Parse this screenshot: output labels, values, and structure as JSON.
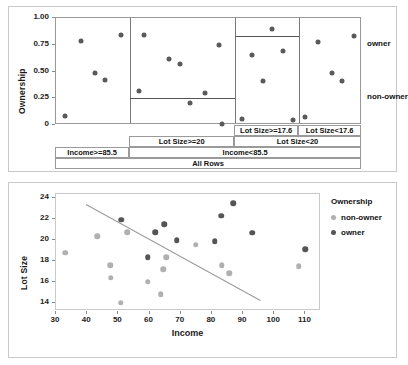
{
  "chart_data": [
    {
      "type": "scatter",
      "id": "partition-plot",
      "title": "",
      "ylabel": "Ownership",
      "xlabel": "",
      "ylim": [
        0,
        1.0
      ],
      "yticks": [
        "0",
        "0.25",
        "0.50",
        "0.75",
        "1.00"
      ],
      "ytick_values": [
        0,
        0.25,
        0.5,
        0.75,
        1.0
      ],
      "grid": false,
      "category_labels_right": [
        "owner",
        "non-owner"
      ],
      "category_label_values": [
        0.75,
        0.25
      ],
      "panels": [
        {
          "name": "Income>=85.5",
          "mean_line": null,
          "points": [
            {
              "x": 0.12,
              "y": 0.08
            },
            {
              "x": 0.33,
              "y": 0.785
            },
            {
              "x": 0.52,
              "y": 0.49
            },
            {
              "x": 0.66,
              "y": 0.425
            },
            {
              "x": 0.87,
              "y": 0.84
            }
          ]
        },
        {
          "name": "Lot Size>=20",
          "mean_line": 0.25,
          "points": [
            {
              "x": 0.08,
              "y": 0.315
            },
            {
              "x": 0.13,
              "y": 0.84
            },
            {
              "x": 0.37,
              "y": 0.615
            },
            {
              "x": 0.47,
              "y": 0.57
            },
            {
              "x": 0.57,
              "y": 0.21
            },
            {
              "x": 0.71,
              "y": 0.3
            },
            {
              "x": 0.85,
              "y": 0.745
            },
            {
              "x": 0.88,
              "y": 0.005
            }
          ]
        },
        {
          "name": "Lot Size>=17.6",
          "mean_line": 0.83,
          "points": [
            {
              "x": 0.11,
              "y": 0.06
            },
            {
              "x": 0.27,
              "y": 0.655
            },
            {
              "x": 0.44,
              "y": 0.41
            },
            {
              "x": 0.58,
              "y": 0.9
            },
            {
              "x": 0.75,
              "y": 0.695
            },
            {
              "x": 0.9,
              "y": 0.05
            }
          ]
        },
        {
          "name": "Lot Size<17.6",
          "mean_line": null,
          "points": [
            {
              "x": 0.09,
              "y": 0.075
            },
            {
              "x": 0.3,
              "y": 0.775
            },
            {
              "x": 0.52,
              "y": 0.485
            },
            {
              "x": 0.68,
              "y": 0.415
            },
            {
              "x": 0.88,
              "y": 0.83
            }
          ]
        }
      ],
      "partition_rows": [
        [
          {
            "label": "Lot Size>=17.6",
            "start": 0.585,
            "end": 0.795
          },
          {
            "label": "Lot Size<17.6",
            "start": 0.795,
            "end": 1.0
          }
        ],
        [
          {
            "label": "Lot Size>=20",
            "start": 0.243,
            "end": 0.585
          },
          {
            "label": "Lot Size<20",
            "start": 0.585,
            "end": 1.0
          }
        ],
        [
          {
            "label": "Income>=85.5",
            "start": 0.0,
            "end": 0.243
          },
          {
            "label": "Income<85.5",
            "start": 0.243,
            "end": 1.0
          }
        ],
        [
          {
            "label": "All Rows",
            "start": 0.0,
            "end": 1.0
          }
        ]
      ]
    },
    {
      "type": "scatter",
      "id": "income-lotsize-scatter",
      "title": "",
      "xlabel": "Income",
      "ylabel": "Lot Size",
      "xlim": [
        30,
        115
      ],
      "ylim": [
        13.2,
        24.4
      ],
      "xticks": [
        "30",
        "40",
        "50",
        "60",
        "70",
        "80",
        "90",
        "100",
        "110"
      ],
      "xtick_values": [
        30,
        40,
        50,
        60,
        70,
        80,
        90,
        100,
        110
      ],
      "yticks": [
        "14",
        "16",
        "18",
        "20",
        "22",
        "24"
      ],
      "ytick_values": [
        14,
        16,
        18,
        20,
        22,
        24
      ],
      "grid": false,
      "legend": {
        "title": "Ownership",
        "position": "right",
        "entries": [
          {
            "label": "non-owner",
            "color": "#b0b0b0"
          },
          {
            "label": "owner",
            "color": "#555555"
          }
        ]
      },
      "fit_line": {
        "x1": 39.5,
        "y1": 23.4,
        "x2": 95.5,
        "y2": 14.2,
        "color": "#9a9a9a"
      },
      "series": [
        {
          "name": "non-owner",
          "color": "#b0b0b0",
          "points": [
            {
              "x": 33.0,
              "y": 18.8
            },
            {
              "x": 43.2,
              "y": 20.35
            },
            {
              "x": 47.4,
              "y": 17.6
            },
            {
              "x": 47.6,
              "y": 16.4
            },
            {
              "x": 50.8,
              "y": 14.0
            },
            {
              "x": 52.8,
              "y": 20.75
            },
            {
              "x": 59.4,
              "y": 16.0
            },
            {
              "x": 63.6,
              "y": 14.8
            },
            {
              "x": 64.4,
              "y": 17.2
            },
            {
              "x": 65.4,
              "y": 18.35
            },
            {
              "x": 74.8,
              "y": 19.55
            },
            {
              "x": 83.2,
              "y": 17.6
            },
            {
              "x": 85.6,
              "y": 16.8
            },
            {
              "x": 107.8,
              "y": 17.5
            }
          ]
        },
        {
          "name": "owner",
          "color": "#555555",
          "points": [
            {
              "x": 50.9,
              "y": 21.95
            },
            {
              "x": 59.4,
              "y": 18.35
            },
            {
              "x": 61.8,
              "y": 20.75
            },
            {
              "x": 64.8,
              "y": 21.5
            },
            {
              "x": 68.8,
              "y": 19.95
            },
            {
              "x": 80.9,
              "y": 19.9
            },
            {
              "x": 83.0,
              "y": 22.3
            },
            {
              "x": 86.8,
              "y": 23.5
            },
            {
              "x": 92.9,
              "y": 20.7
            },
            {
              "x": 110.0,
              "y": 19.1
            }
          ]
        }
      ]
    }
  ]
}
